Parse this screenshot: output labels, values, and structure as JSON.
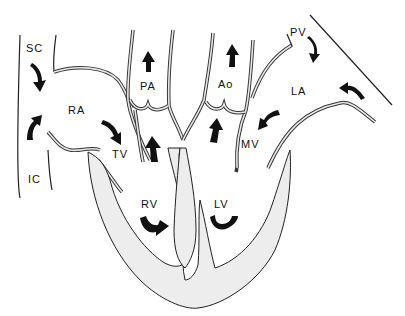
{
  "diagram": {
    "labels": {
      "SC": "SC",
      "IC": "IC",
      "RA": "RA",
      "TV": "TV",
      "PA": "PA",
      "Ao": "Ao",
      "PV": "PV",
      "LA": "LA",
      "MV": "MV",
      "RV": "RV",
      "LV": "LV"
    },
    "arrows": [
      {
        "name": "arrow-sc-into-ra",
        "direction": "down-right"
      },
      {
        "name": "arrow-ic-into-ra",
        "direction": "up"
      },
      {
        "name": "arrow-ra-through-tv",
        "direction": "down-right"
      },
      {
        "name": "arrow-pa-up",
        "direction": "up"
      },
      {
        "name": "arrow-rv-outflow",
        "direction": "up"
      },
      {
        "name": "arrow-ao-up",
        "direction": "up"
      },
      {
        "name": "arrow-lv-outflow",
        "direction": "up"
      },
      {
        "name": "arrow-pv-into-la",
        "direction": "down"
      },
      {
        "name": "arrow-la-inflow",
        "direction": "left"
      },
      {
        "name": "arrow-la-through-mv",
        "direction": "down-left"
      },
      {
        "name": "arrow-rv-curl",
        "direction": "curved"
      },
      {
        "name": "arrow-lv-curl",
        "direction": "curved"
      }
    ]
  }
}
